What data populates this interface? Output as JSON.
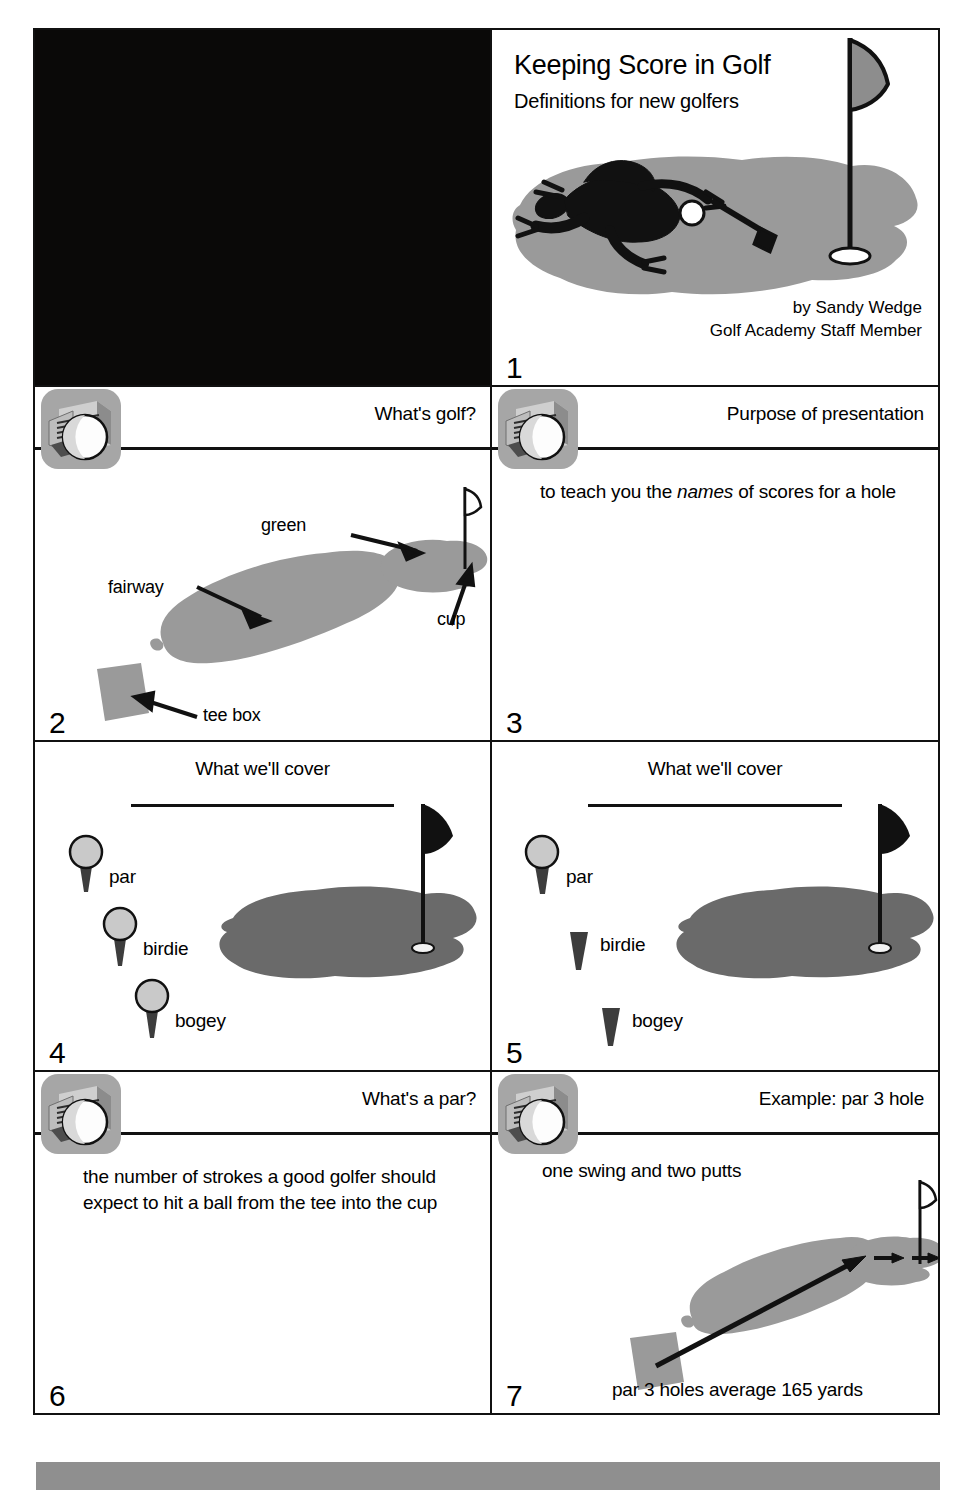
{
  "document": {
    "kind": "presentation-handout",
    "slide_count_visible": 7
  },
  "colors": {
    "ink": "#111111",
    "paper": "#ffffff",
    "turf_light": "#9a9a9a",
    "turf_dark": "#6a6a6a",
    "icon_gray": "#a6a6a6",
    "bottom_bar": "#8f8f8f",
    "placeholder_black": "#0a0908"
  },
  "placeholder": {
    "name": "black-image-placeholder"
  },
  "bottom_bar": {
    "name": "gray-footer-bar"
  },
  "slides": [
    {
      "number": "1",
      "layout": "title",
      "title": "Keeping Score in Golf",
      "subtitle": "Definitions for new golfers",
      "byline_1": "by Sandy Wedge",
      "byline_2": "Golf Academy Staff Member",
      "art": "golfer-putting-on-green-with-flag"
    },
    {
      "number": "2",
      "layout": "icon-header",
      "title": "What's golf?",
      "art": "course-diagram-labeled",
      "labels": [
        {
          "text": "green",
          "name": "green-label"
        },
        {
          "text": "cup",
          "name": "cup-label"
        },
        {
          "text": "fairway",
          "name": "fairway-label"
        },
        {
          "text": "tee box",
          "name": "tee-box-label"
        }
      ]
    },
    {
      "number": "3",
      "layout": "icon-header",
      "title": "Purpose of presentation",
      "body_before": "to teach you the ",
      "body_emphasis": "names",
      "body_after": " of scores for a hole"
    },
    {
      "number": "4",
      "layout": "centered-header",
      "title": "What we'll cover",
      "art": "three-tees-with-balls-and-green",
      "items": [
        "par",
        "birdie",
        "bogey"
      ],
      "balls_present": [
        true,
        true,
        true
      ]
    },
    {
      "number": "5",
      "layout": "centered-header",
      "title": "What we'll cover",
      "art": "three-tees-first-ball-only-and-green",
      "items": [
        "par",
        "birdie",
        "bogey"
      ],
      "balls_present": [
        true,
        false,
        false
      ]
    },
    {
      "number": "6",
      "layout": "icon-header",
      "title": "What's a par?",
      "body": "the number of strokes a good golfer should expect to hit a ball from the tee into the cup"
    },
    {
      "number": "7",
      "layout": "icon-header",
      "title": "Example: par 3 hole",
      "body": "one swing and two putts",
      "footnote": "par 3 holes average 165 yards",
      "art": "course-diagram-with-shot-arrows"
    }
  ],
  "icons": {
    "projector_ball": "presentation-projector-with-golf-ball-icon"
  }
}
